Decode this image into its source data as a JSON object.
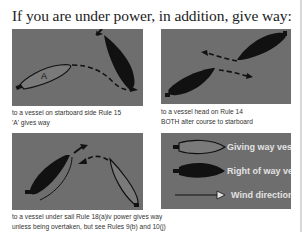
{
  "title": "If you are under power, in addition, give way:",
  "panels": [
    {
      "id": "starboard",
      "vessel_label": "A",
      "caption_lines": [
        "to a vessel on starboard side Rule 15",
        "'A' gives way"
      ]
    },
    {
      "id": "head-on",
      "caption_lines": [
        "to a vessel head on Rule 14",
        "BOTH alter course to starboard"
      ]
    },
    {
      "id": "under-sail",
      "caption_lines": [
        "to a vessel under sail Rule 18(a)iv power gives way",
        "unless being overtaken, but see Rules 9(b) and 10(j)"
      ]
    },
    {
      "id": "legend",
      "items": [
        {
          "icon": "giving-way-vessel-icon",
          "label": "Giving way vessel"
        },
        {
          "icon": "right-of-way-vessel-icon",
          "label": "Right of way vessel"
        },
        {
          "icon": "wind-direction-arrow-icon",
          "label": "Wind direction"
        }
      ]
    }
  ],
  "colors": {
    "panel_bg": "#6e6e6e",
    "giving_way_fill": "#7a7a7a",
    "right_of_way_fill": "#111111",
    "text": "#333333"
  }
}
